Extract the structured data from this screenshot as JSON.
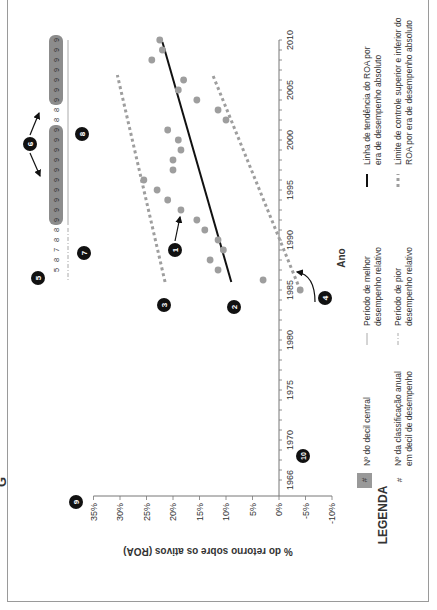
{
  "figure_letter": "G",
  "chart_data": {
    "type": "scatter",
    "orientation_note": "figure is rotated 90 degrees counter-clockwise on the page",
    "title": "",
    "xlabel": "Ano",
    "ylabel": "% do retorno sobre os ativos (ROA)",
    "xlim": [
      1966,
      2010
    ],
    "ylim": [
      -10,
      35
    ],
    "x_ticks": [
      "1966",
      "1970",
      "1975",
      "1980",
      "1985",
      "1990",
      "1995",
      "2000",
      "2005",
      "2010"
    ],
    "y_ticks": [
      "35%",
      "30%",
      "25%",
      "20%",
      "15%",
      "10%",
      "5%",
      "0%",
      "-5%",
      "-10%"
    ],
    "grid": false,
    "series": [
      {
        "name": "ROA anual",
        "type": "scatter",
        "color": "#9e9e9e",
        "points": [
          {
            "x": 1985,
            "y": -4
          },
          {
            "x": 1986,
            "y": 3
          },
          {
            "x": 1987,
            "y": 11.5
          },
          {
            "x": 1988,
            "y": 13
          },
          {
            "x": 1989,
            "y": 10.5
          },
          {
            "x": 1990,
            "y": 11.5
          },
          {
            "x": 1991,
            "y": 14
          },
          {
            "x": 1992,
            "y": 15.5
          },
          {
            "x": 1993,
            "y": 18.5
          },
          {
            "x": 1994,
            "y": 21
          },
          {
            "x": 1995,
            "y": 23
          },
          {
            "x": 1996,
            "y": 25.5
          },
          {
            "x": 1997,
            "y": 20
          },
          {
            "x": 1998,
            "y": 20
          },
          {
            "x": 1999,
            "y": 18.5
          },
          {
            "x": 2000,
            "y": 19
          },
          {
            "x": 2001,
            "y": 21
          },
          {
            "x": 2002,
            "y": 10
          },
          {
            "x": 2003,
            "y": 11.5
          },
          {
            "x": 2004,
            "y": 15.5
          },
          {
            "x": 2005,
            "y": 19
          },
          {
            "x": 2006,
            "y": 18
          },
          {
            "x": 2008,
            "y": 24
          },
          {
            "x": 2009,
            "y": 22
          },
          {
            "x": 2010,
            "y": 22.5
          }
        ]
      },
      {
        "name": "Linha de tendência do ROA por era de desempenho absoluto",
        "type": "line",
        "style": "solid",
        "color": "#111111",
        "points": [
          {
            "x": 1985.8,
            "y": 9
          },
          {
            "x": 2009.8,
            "y": 22
          }
        ]
      },
      {
        "name": "Limite de controle superior do ROA",
        "type": "line",
        "style": "dotted",
        "color": "#9e9e9e",
        "points": [
          {
            "x": 1985.8,
            "y": 21.5
          },
          {
            "x": 2006.5,
            "y": 30.5
          }
        ]
      },
      {
        "name": "Limite de controle inferior do ROA",
        "type": "line",
        "style": "dotted",
        "color": "#9e9e9e",
        "points": [
          {
            "x": 1985.0,
            "y": -4
          },
          {
            "x": 2006.5,
            "y": 12.5
          }
        ]
      }
    ],
    "decile_strip": {
      "label": "Nº da classificação anual em decil de desempenho",
      "years_from": 1987,
      "years_to": 2010,
      "values_oldest_first": [
        5,
        8,
        7,
        8,
        8,
        9,
        9,
        9,
        9,
        9,
        9,
        9,
        9,
        9,
        9,
        8,
        8,
        9,
        9,
        9,
        9,
        9,
        9,
        9
      ],
      "central_decile_boxes": [
        {
          "from": 1992,
          "to": 2001,
          "value": 9
        },
        {
          "from": 2004,
          "to": 2010,
          "value": 9
        }
      ]
    },
    "annotations": [
      {
        "id": "1",
        "desc": "arrow to 1993 point"
      },
      {
        "id": "2",
        "desc": "start of trend line"
      },
      {
        "id": "3",
        "desc": "start of upper control limit"
      },
      {
        "id": "4",
        "desc": "curved arrow to lower control limit"
      },
      {
        "id": "5",
        "desc": "decile strip start"
      },
      {
        "id": "6",
        "desc": "arrows to central decile boxes"
      },
      {
        "id": "7",
        "desc": "worse relative performance period"
      },
      {
        "id": "8",
        "desc": "better relative performance period"
      },
      {
        "id": "9",
        "desc": "ROA axis"
      },
      {
        "id": "10",
        "desc": "year axis"
      }
    ]
  },
  "legend": {
    "title": "LEGENDA",
    "items": [
      {
        "symbol": "#",
        "boxed": true,
        "label": "Nº  do decil central"
      },
      {
        "symbol": "#",
        "boxed": false,
        "label_lines": [
          "Nº da classificação anual",
          "em decil de desempenho"
        ]
      },
      {
        "symbol": "thin-line",
        "label_lines": [
          "Período de melhor",
          "desempenho relativo"
        ]
      },
      {
        "symbol": "dash-dot-line",
        "label_lines": [
          "Período de pior",
          "desempenho relativo"
        ]
      },
      {
        "symbol": "solid-line",
        "label_lines": [
          "Linha de tendência do ROA por",
          "era de desempenho absoluto"
        ]
      },
      {
        "symbol": "dotted-line",
        "label_lines": [
          "Limite de controle superior e inferior do",
          "ROA por era de desempenho absoluto"
        ]
      }
    ]
  },
  "colors": {
    "points": "#9e9e9e",
    "trend": "#111111",
    "control": "#9e9e9e",
    "box": "#8c8c8c",
    "marker": "#111111"
  }
}
